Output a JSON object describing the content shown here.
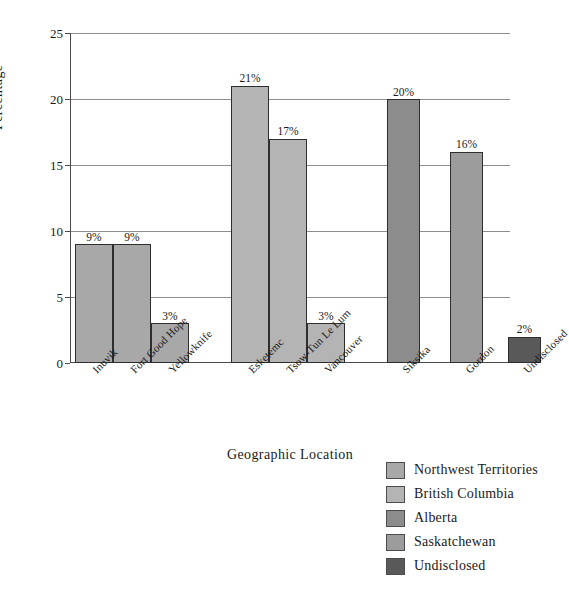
{
  "chart_data": {
    "type": "bar",
    "title": "",
    "xlabel": "Geographic Location",
    "ylabel": "Percentage",
    "ylim": [
      0,
      25
    ],
    "yticks": [
      0,
      5,
      10,
      15,
      20,
      25
    ],
    "grid": true,
    "legend_position": "bottom-right",
    "categories": [
      "Inuvik",
      "Fort Good Hope",
      "Yellowknife",
      "Esketemc",
      "Tsow-Tun Le Lum",
      "Vancouver",
      "Siksika",
      "Gordon",
      "Undisclosed"
    ],
    "values": [
      9,
      9,
      3,
      21,
      17,
      3,
      20,
      16,
      2
    ],
    "value_labels": [
      "9%",
      "9%",
      "3%",
      "21%",
      "17%",
      "3%",
      "20%",
      "16%",
      "2%"
    ],
    "bar_groups": [
      "Northwest Territories",
      "Northwest Territories",
      "Northwest Territories",
      "British Columbia",
      "British Columbia",
      "British Columbia",
      "Alberta",
      "Saskatchewan",
      "Undisclosed"
    ],
    "bar_colors": [
      "#a8a8a8",
      "#a8a8a8",
      "#a8a8a8",
      "#b4b4b4",
      "#b4b4b4",
      "#b4b4b4",
      "#8c8c8c",
      "#9c9c9c",
      "#595959"
    ]
  },
  "axis": {
    "y_title": "Percentage",
    "x_title": "Geographic Location",
    "y_tick_labels": [
      "0",
      "5",
      "10",
      "15",
      "20",
      "25"
    ]
  },
  "legend": {
    "items": [
      {
        "label": "Northwest Territories",
        "color": "#a8a8a8"
      },
      {
        "label": "British Columbia",
        "color": "#b4b4b4"
      },
      {
        "label": "Alberta",
        "color": "#8c8c8c"
      },
      {
        "label": "Saskatchewan",
        "color": "#9c9c9c"
      },
      {
        "label": "Undisclosed",
        "color": "#595959"
      }
    ]
  }
}
